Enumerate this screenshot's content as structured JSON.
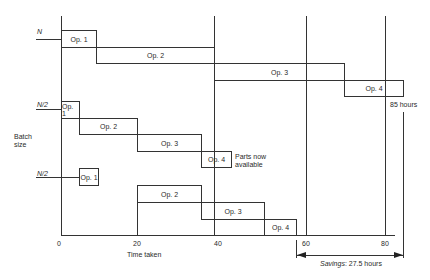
{
  "diagram": {
    "y_axis_label_line1": "Batch",
    "y_axis_label_line2": "size",
    "x_axis_label": "Time taken",
    "x_ticks": [
      "0",
      "20",
      "40",
      "60",
      "80"
    ],
    "batch_labels": [
      "N",
      "N/2",
      "N/2"
    ],
    "groups": [
      {
        "batch": "N",
        "ops": [
          {
            "label": "Op. 1",
            "start": 0,
            "end": 10
          },
          {
            "label": "Op. 2",
            "start": 10,
            "end": 40
          },
          {
            "label": "Op. 3",
            "start": 40,
            "end": 70
          },
          {
            "label": "Op. 4",
            "start": 70,
            "end": 85
          }
        ]
      },
      {
        "batch": "N/2",
        "ops": [
          {
            "label": "Op. 1",
            "start": 0,
            "end": 5
          },
          {
            "label": "Op. 2",
            "start": 5,
            "end": 20
          },
          {
            "label": "Op. 3",
            "start": 20,
            "end": 35
          },
          {
            "label": "Op. 4",
            "start": 35,
            "end": 42.5
          }
        ]
      },
      {
        "batch": "N/2",
        "ops": [
          {
            "label": "Op. 1",
            "start": 5,
            "end": 10
          },
          {
            "label": "Op. 2",
            "start": 20,
            "end": 35
          },
          {
            "label": "Op. 3",
            "start": 35,
            "end": 50
          },
          {
            "label": "Op. 4",
            "start": 50,
            "end": 57.5
          }
        ]
      }
    ],
    "annotations": {
      "total_time": "85 hours",
      "parts_available_line1": "Parts now",
      "parts_available_line2": "available",
      "savings_prefix": "Savings",
      "savings_value": ": 27.5 hours"
    }
  }
}
